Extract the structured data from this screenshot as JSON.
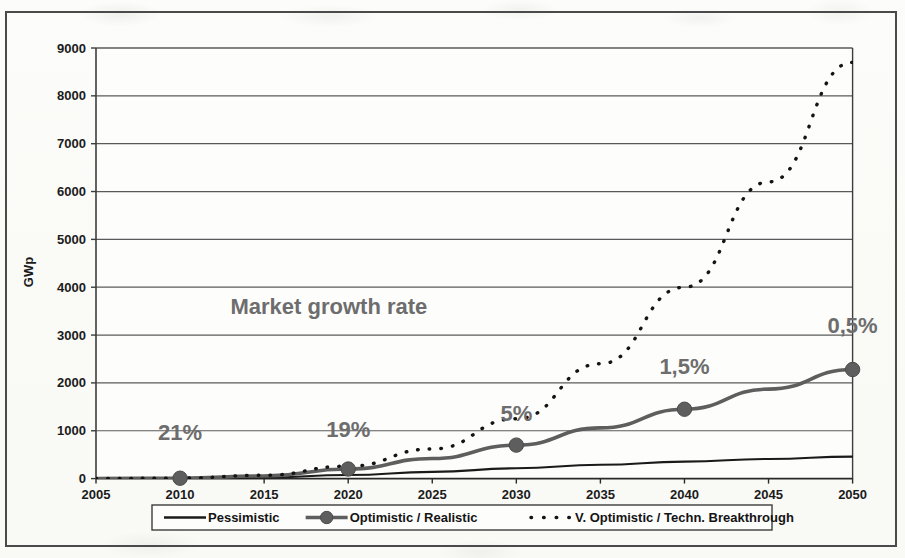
{
  "figure": {
    "background_color": "#fbfbf8",
    "frame_color": "#4a4a4a",
    "annotation_color": "#6d6d6d"
  },
  "chart_data": {
    "type": "line",
    "title": "",
    "xlabel": "",
    "ylabel": "GWp",
    "xlim": [
      2005,
      2050
    ],
    "ylim": [
      0,
      9000
    ],
    "grid": true,
    "grid_axis": "y",
    "legend_position": "bottom-outside",
    "x_ticks": [
      2005,
      2010,
      2015,
      2020,
      2025,
      2030,
      2035,
      2040,
      2045,
      2050
    ],
    "x_tick_labels": [
      "2005",
      "2010",
      "2015",
      "2020",
      "2025",
      "2030",
      "2035",
      "2040",
      "2045",
      "2050"
    ],
    "y_ticks": [
      0,
      1000,
      2000,
      3000,
      4000,
      5000,
      6000,
      7000,
      8000,
      9000
    ],
    "y_tick_labels": [
      "0",
      "1000",
      "2000",
      "3000",
      "4000",
      "5000",
      "6000",
      "7000",
      "8000",
      "9000"
    ],
    "x": [
      2005,
      2010,
      2015,
      2020,
      2025,
      2030,
      2035,
      2040,
      2045,
      2050
    ],
    "series": [
      {
        "name": "Pessimistic",
        "style": "solid",
        "color": "#1a1a1a",
        "marker": "none",
        "values": [
          2,
          8,
          25,
          75,
          140,
          215,
          290,
          355,
          410,
          460
        ]
      },
      {
        "name": "Optimistic / Realistic",
        "style": "solid",
        "color": "#5e5e5e",
        "marker": "circle",
        "marker_at": [
          2010,
          2020,
          2030,
          2040,
          2050
        ],
        "values": [
          2,
          8,
          55,
          200,
          420,
          700,
          1060,
          1450,
          1870,
          2280
        ]
      },
      {
        "name": "V. Optimistic / Techn. Breakthrough",
        "style": "dotted",
        "color": "#141414",
        "marker": "none",
        "values": [
          2,
          10,
          70,
          260,
          620,
          1250,
          2400,
          4000,
          6200,
          8700
        ]
      }
    ],
    "annotations": [
      {
        "label": "21%",
        "x": 2010,
        "y": 800
      },
      {
        "label": "19%",
        "x": 2020,
        "y": 860
      },
      {
        "label": "5%",
        "x": 2030,
        "y": 1200
      },
      {
        "label": "1,5%",
        "x": 2040,
        "y": 2180
      },
      {
        "label": "0,5%",
        "x": 2050,
        "y": 3050
      }
    ],
    "callout": {
      "text": "Market growth rate",
      "x": 2013,
      "y": 3450
    }
  },
  "legend": {
    "entries": [
      {
        "label": "Pessimistic",
        "swatch": "solid-line"
      },
      {
        "label": "Optimistic / Realistic",
        "swatch": "solid-line-marker"
      },
      {
        "label": "V. Optimistic / Techn. Breakthrough",
        "swatch": "dotted-line"
      }
    ]
  }
}
